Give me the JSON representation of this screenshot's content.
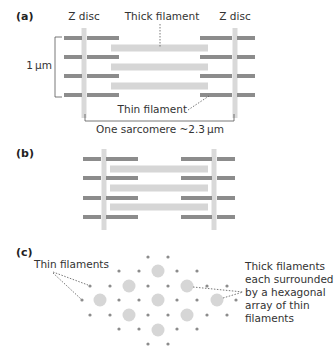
{
  "colors": {
    "thin_filament": "#8c8c8c",
    "thick_filament": "#d6d6d6",
    "z_disc": "#d9d9d9",
    "line": "#555555",
    "text": "#333333"
  },
  "panel_a": {
    "label": "(a)",
    "z_disc_left_label": "Z disc",
    "z_disc_right_label": "Z disc",
    "thick_filament_label": "Thick filament",
    "thin_filament_label": "Thin filament",
    "scale_label": "1 µm",
    "sarcomere_label": "One sarcomere ~2.3 µm",
    "z_discs_x": [
      84,
      235
    ],
    "z_disc_y": [
      28,
      118
    ],
    "thin_rows_y": [
      38,
      57,
      76,
      95
    ],
    "thin_segments": [
      [
        64,
        82
      ],
      [
        87,
        119
      ],
      [
        200,
        232
      ],
      [
        237,
        255
      ]
    ],
    "thick_rows_y": [
      48,
      67,
      86
    ],
    "thick_segment": [
      111,
      208
    ]
  },
  "panel_b": {
    "label": "(b)",
    "z_discs_x": [
      104,
      214
    ],
    "z_disc_y": [
      149,
      230
    ],
    "thin_rows_y": [
      159,
      178,
      198,
      217
    ],
    "thin_segments": [
      [
        83,
        101
      ],
      [
        106,
        138
      ],
      [
        181,
        212
      ],
      [
        217,
        235
      ]
    ],
    "thick_rows_y": [
      169,
      188,
      207
    ],
    "thick_segment": [
      110,
      208
    ]
  },
  "panel_c": {
    "label": "(c)",
    "thin_label": "Thin filaments",
    "thick_label_lines": [
      "Thick filaments",
      "each surrounded",
      "by a hexagonal",
      "array of thin",
      "filaments"
    ],
    "thick_filaments": [
      [
        158,
        271
      ],
      [
        129,
        286
      ],
      [
        187,
        286
      ],
      [
        100,
        300
      ],
      [
        158,
        300
      ],
      [
        217,
        300
      ],
      [
        129,
        315
      ],
      [
        187,
        315
      ],
      [
        158,
        330
      ]
    ],
    "thin_filaments": [
      [
        148,
        257
      ],
      [
        168,
        257
      ],
      [
        119,
        271
      ],
      [
        139,
        271
      ],
      [
        177,
        271
      ],
      [
        197,
        271
      ],
      [
        90,
        286
      ],
      [
        110,
        286
      ],
      [
        148,
        286
      ],
      [
        168,
        286
      ],
      [
        207,
        286
      ],
      [
        227,
        286
      ],
      [
        82,
        300
      ],
      [
        119,
        300
      ],
      [
        139,
        300
      ],
      [
        177,
        300
      ],
      [
        197,
        300
      ],
      [
        236,
        300
      ],
      [
        90,
        315
      ],
      [
        110,
        315
      ],
      [
        148,
        315
      ],
      [
        168,
        315
      ],
      [
        207,
        315
      ],
      [
        227,
        315
      ],
      [
        119,
        329
      ],
      [
        139,
        329
      ],
      [
        177,
        329
      ],
      [
        197,
        329
      ],
      [
        148,
        344
      ],
      [
        168,
        344
      ]
    ]
  }
}
